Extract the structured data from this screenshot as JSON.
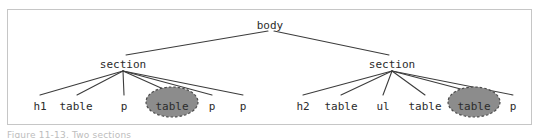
{
  "figure": {
    "kind": "dom-tree-diagram",
    "title": "body",
    "frame": {
      "x": 7,
      "y": 9,
      "width": 525,
      "height": 116,
      "border_color": "#c6c6c6",
      "background": "#ffffff"
    },
    "colors": {
      "edge": "#3c3c3c",
      "text": "#2b2b2b",
      "highlight_fill": "#8c8c8c",
      "highlight_stroke": "#4a4a4a",
      "frame": "#c6c6c6",
      "caption": "#bdbdbd"
    },
    "nodes": {
      "root": {
        "id": "body",
        "label": "body",
        "x": 270,
        "y": 25,
        "highlighted": false
      },
      "level2": [
        {
          "id": "section-left",
          "label": "section",
          "x": 123,
          "y": 64,
          "highlighted": false
        },
        {
          "id": "section-right",
          "label": "section",
          "x": 392,
          "y": 64,
          "highlighted": false
        }
      ],
      "leaves_left": [
        {
          "id": "l-h1",
          "label": "h1",
          "x": 40,
          "y": 106,
          "highlighted": false
        },
        {
          "id": "l-table1",
          "label": "table",
          "x": 76,
          "y": 106,
          "highlighted": false
        },
        {
          "id": "l-p1",
          "label": "p",
          "x": 124,
          "y": 106,
          "highlighted": false
        },
        {
          "id": "l-table2",
          "label": "table",
          "x": 172,
          "y": 106,
          "highlighted": true
        },
        {
          "id": "l-p2",
          "label": "p",
          "x": 212,
          "y": 106,
          "highlighted": false
        },
        {
          "id": "l-p3",
          "label": "p",
          "x": 243,
          "y": 106,
          "highlighted": false
        }
      ],
      "leaves_right": [
        {
          "id": "r-h2",
          "label": "h2",
          "x": 303,
          "y": 106,
          "highlighted": false
        },
        {
          "id": "r-table1",
          "label": "table",
          "x": 341,
          "y": 106,
          "highlighted": false
        },
        {
          "id": "r-ul",
          "label": "ul",
          "x": 383,
          "y": 106,
          "highlighted": false
        },
        {
          "id": "r-table2",
          "label": "table",
          "x": 425,
          "y": 106,
          "highlighted": false
        },
        {
          "id": "r-table3",
          "label": "table",
          "x": 474,
          "y": 106,
          "highlighted": true
        },
        {
          "id": "r-p1",
          "label": "p",
          "x": 513,
          "y": 106,
          "highlighted": false
        }
      ]
    },
    "highlight_ellipses": [
      {
        "id": "ellipse-left-table",
        "cx": 172,
        "cy": 102,
        "rx": 26,
        "ry": 15
      },
      {
        "id": "ellipse-right-table",
        "cx": 474,
        "cy": 102,
        "rx": 26,
        "ry": 15
      }
    ],
    "caption": "Figure 11-13. Two sections"
  }
}
